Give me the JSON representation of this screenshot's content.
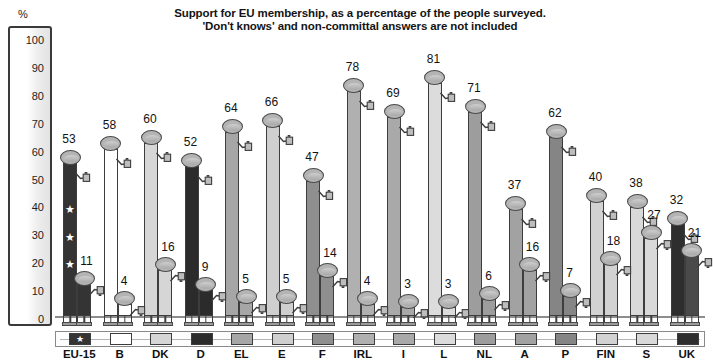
{
  "title": {
    "line1": "Support for EU membership, as a percentage of the people surveyed.",
    "line2": "'Don't knows' and non-committal answers are not included"
  },
  "axis": {
    "unit_symbol": "%",
    "ticks": [
      "100",
      "90",
      "80",
      "70",
      "60",
      "50",
      "40",
      "30",
      "20",
      "10",
      "0"
    ]
  },
  "chart_data": {
    "type": "bar",
    "title": "Support for EU membership, as a percentage of the people surveyed. 'Don't knows' and non-committal answers are not included",
    "xlabel": "",
    "ylabel": "%",
    "ylim": [
      0,
      100
    ],
    "grid": false,
    "legend_position": "bottom",
    "categories": [
      "EU-15",
      "B",
      "DK",
      "D",
      "EL",
      "E",
      "F",
      "IRL",
      "I",
      "L",
      "NL",
      "A",
      "P",
      "FIN",
      "S",
      "UK"
    ],
    "series": [
      {
        "name": "For (support)",
        "values": [
          53,
          58,
          60,
          52,
          64,
          66,
          47,
          78,
          69,
          81,
          71,
          37,
          62,
          40,
          38,
          32
        ]
      },
      {
        "name": "Against",
        "values": [
          11,
          4,
          16,
          9,
          5,
          5,
          14,
          4,
          3,
          3,
          6,
          16,
          7,
          18,
          27,
          21
        ]
      }
    ],
    "series_colors": [
      "#343434",
      "#ffffff",
      "#d6d6d6",
      "#2b2b2b",
      "#a6a6a6",
      "#cfcfcf",
      "#8f8f8f",
      "#b0b0b0",
      "#a9a9a9",
      "#dcdcdc",
      "#9d9d9d",
      "#a2a2a2",
      "#858585",
      "#d2d2d2",
      "#d9d9d9",
      "#2e2e2e"
    ]
  },
  "bars": [
    {
      "code": "EU-15",
      "for": 53,
      "against": 11,
      "color": "#343434",
      "stars": true,
      "against_color": "#343434"
    },
    {
      "code": "B",
      "for": 58,
      "against": 4,
      "color": "#ffffff",
      "stars": false,
      "against_color": "#ffffff"
    },
    {
      "code": "DK",
      "for": 60,
      "against": 16,
      "color": "#d6d6d6",
      "stars": false,
      "against_color": "#d6d6d6"
    },
    {
      "code": "D",
      "for": 52,
      "against": 9,
      "color": "#2b2b2b",
      "stars": false,
      "against_color": "#2b2b2b"
    },
    {
      "code": "EL",
      "for": 64,
      "against": 5,
      "color": "#a6a6a6",
      "stars": false,
      "against_color": "#a6a6a6"
    },
    {
      "code": "E",
      "for": 66,
      "against": 5,
      "color": "#cfcfcf",
      "stars": false,
      "against_color": "#cfcfcf"
    },
    {
      "code": "F",
      "for": 47,
      "against": 14,
      "color": "#8f8f8f",
      "stars": false,
      "against_color": "#8f8f8f"
    },
    {
      "code": "IRL",
      "for": 78,
      "against": 4,
      "color": "#b0b0b0",
      "stars": false,
      "against_color": "#b0b0b0"
    },
    {
      "code": "I",
      "for": 69,
      "against": 3,
      "color": "#a9a9a9",
      "stars": false,
      "against_color": "#a9a9a9"
    },
    {
      "code": "L",
      "for": 81,
      "against": 3,
      "color": "#dcdcdc",
      "stars": false,
      "against_color": "#dcdcdc"
    },
    {
      "code": "NL",
      "for": 71,
      "against": 6,
      "color": "#9d9d9d",
      "stars": false,
      "against_color": "#9d9d9d"
    },
    {
      "code": "A",
      "for": 37,
      "against": 16,
      "color": "#a2a2a2",
      "stars": false,
      "against_color": "#a2a2a2"
    },
    {
      "code": "P",
      "for": 62,
      "against": 7,
      "color": "#858585",
      "stars": false,
      "against_color": "#858585"
    },
    {
      "code": "FIN",
      "for": 40,
      "against": 18,
      "color": "#d2d2d2",
      "stars": false,
      "against_color": "#d2d2d2"
    },
    {
      "code": "S",
      "for": 38,
      "against": 27,
      "color": "#d9d9d9",
      "stars": false,
      "against_color": "#d9d9d9"
    },
    {
      "code": "UK",
      "for": 32,
      "against": 21,
      "color": "#2e2e2e",
      "stars": false,
      "against_color": "#4a4a4a"
    }
  ],
  "legend": [
    {
      "code": "EU-15",
      "color": "#343434",
      "star": true
    },
    {
      "code": "B",
      "color": "#ffffff",
      "star": false
    },
    {
      "code": "DK",
      "color": "#d6d6d6",
      "star": false
    },
    {
      "code": "D",
      "color": "#2b2b2b",
      "star": false
    },
    {
      "code": "EL",
      "color": "#a6a6a6",
      "star": false
    },
    {
      "code": "E",
      "color": "#cfcfcf",
      "star": false
    },
    {
      "code": "F",
      "color": "#8f8f8f",
      "star": false
    },
    {
      "code": "IRL",
      "color": "#b0b0b0",
      "star": false
    },
    {
      "code": "I",
      "color": "#a9a9a9",
      "star": false
    },
    {
      "code": "L",
      "color": "#dcdcdc",
      "star": false
    },
    {
      "code": "NL",
      "color": "#9d9d9d",
      "star": false
    },
    {
      "code": "A",
      "color": "#a2a2a2",
      "star": false
    },
    {
      "code": "P",
      "color": "#858585",
      "star": false
    },
    {
      "code": "FIN",
      "color": "#d2d2d2",
      "star": false
    },
    {
      "code": "S",
      "color": "#d9d9d9",
      "star": false
    },
    {
      "code": "UK",
      "color": "#2e2e2e",
      "star": false
    }
  ],
  "icons": {
    "thumb_up": "thumbs-up-icon",
    "thumb_down": "thumbs-down-icon",
    "star": "star-icon"
  }
}
